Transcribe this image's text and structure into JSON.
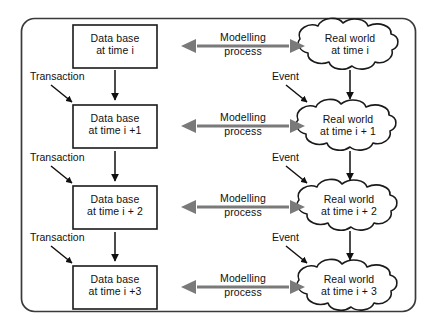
{
  "diagram": {
    "frame": {
      "shape": "rounded-rectangle",
      "stroke": "#3a3a3a"
    },
    "colors": {
      "outline": "#1a1a1a",
      "frame": "#3a3a3a",
      "arrow_black": "#111111",
      "arrow_gray": "#7a7a7a",
      "background": "#ffffff",
      "text": "#111111"
    },
    "database_nodes": [
      {
        "id": "db-0",
        "line1": "Data base",
        "line2": "at time i"
      },
      {
        "id": "db-1",
        "line1": "Data base",
        "line2": "at time i +1"
      },
      {
        "id": "db-2",
        "line1": "Data base",
        "line2": "at time i + 2"
      },
      {
        "id": "db-3",
        "line1": "Data base",
        "line2": "at time i +3"
      }
    ],
    "real_world_nodes": [
      {
        "id": "rw-0",
        "line1": "Real world",
        "line2": "at time i"
      },
      {
        "id": "rw-1",
        "line1": "Real world",
        "line2": "at time i + 1"
      },
      {
        "id": "rw-2",
        "line1": "Real world",
        "line2": "at time i + 2"
      },
      {
        "id": "rw-3",
        "line1": "Real world",
        "line2": "at time i + 3"
      }
    ],
    "modelling_arrows": [
      {
        "id": "mod-0",
        "line1": "Modelling",
        "line2": "process",
        "direction": "bidirectional"
      },
      {
        "id": "mod-1",
        "line1": "Modelling",
        "line2": "process",
        "direction": "bidirectional"
      },
      {
        "id": "mod-2",
        "line1": "Modelling",
        "line2": "process",
        "direction": "bidirectional"
      },
      {
        "id": "mod-3",
        "line1": "Modelling",
        "line2": "process",
        "direction": "bidirectional"
      }
    ],
    "transaction_labels": [
      {
        "id": "tx-1",
        "label": "Transaction"
      },
      {
        "id": "tx-2",
        "label": "Transaction"
      },
      {
        "id": "tx-3",
        "label": "Transaction"
      }
    ],
    "event_labels": [
      {
        "id": "ev-1",
        "label": "Event"
      },
      {
        "id": "ev-2",
        "label": "Event"
      },
      {
        "id": "ev-3",
        "label": "Event"
      }
    ]
  }
}
